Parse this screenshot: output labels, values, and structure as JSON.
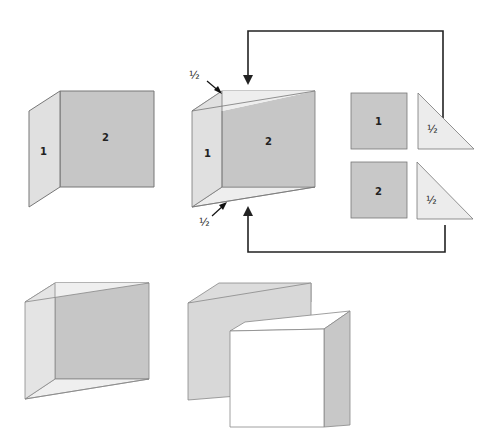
{
  "diagram": {
    "fig1": {
      "face1_label": "1",
      "face2_label": "2"
    },
    "fig2": {
      "face1_label": "1",
      "face2_label": "2",
      "top_label": "½",
      "bottom_label": "½"
    },
    "pieces": [
      {
        "shape": "square",
        "label": "1"
      },
      {
        "shape": "triangle",
        "label": "½"
      },
      {
        "shape": "square",
        "label": "2"
      },
      {
        "shape": "triangle",
        "label": "½"
      }
    ],
    "colors": {
      "dark_face": "#c4c4c4",
      "light_face": "#e2e2e2",
      "triangle_face": "#ececec",
      "outline": "#666666",
      "arrow": "#222222",
      "white_face": "#ffffff"
    }
  }
}
